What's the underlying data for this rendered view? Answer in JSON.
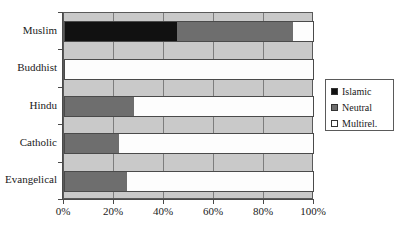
{
  "chart_data": {
    "type": "bar",
    "orientation": "horizontal",
    "stacked": true,
    "normalized": true,
    "title": "",
    "xlabel": "",
    "ylabel": "",
    "categories": [
      "Muslim",
      "Buddhist",
      "Hindu",
      "Catholic",
      "Evangelical"
    ],
    "series": [
      {
        "name": "Islamic",
        "color": "#111111",
        "values": [
          45.2,
          0,
          0,
          0,
          0
        ]
      },
      {
        "name": "Neutral",
        "color": "#6e6e6e",
        "values": [
          46.4,
          0,
          28.0,
          22.0,
          25.2
        ]
      },
      {
        "name": "Multirel.",
        "color": "#ffffff",
        "values": [
          8.4,
          100.0,
          72.0,
          78.0,
          74.8
        ]
      }
    ],
    "xlim": [
      0,
      100
    ],
    "xticks": [
      0,
      20,
      40,
      60,
      80,
      100
    ],
    "xtick_labels": [
      "0%",
      "20%",
      "40%",
      "60%",
      "80%",
      "100%"
    ],
    "grid": true,
    "grid_axis": "x",
    "legend_position": "right",
    "plot_background": "#c9c9c9"
  },
  "legend": {
    "items": [
      {
        "label": "Islamic",
        "swatch": "islamic"
      },
      {
        "label": "Neutral",
        "swatch": "neutral"
      },
      {
        "label": "Multirel.",
        "swatch": "multirel"
      }
    ]
  }
}
